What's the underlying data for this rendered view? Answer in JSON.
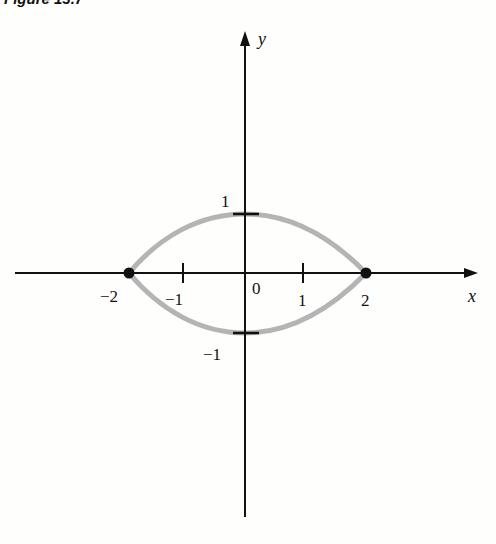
{
  "figure": {
    "title": "Figure 13.7",
    "axes": {
      "x_label": "x",
      "y_label": "y",
      "x_ticks": [
        "−2",
        "−1",
        "0",
        "1",
        "2"
      ],
      "y_ticks": [
        "1",
        "−1"
      ]
    },
    "curve": {
      "description": "closed lens-shaped curve through (−2,0), (0,1), (2,0), (0,−1)",
      "color": "#b4b4b4",
      "points_marked": [
        [
          -2,
          0
        ],
        [
          2,
          0
        ]
      ]
    }
  }
}
